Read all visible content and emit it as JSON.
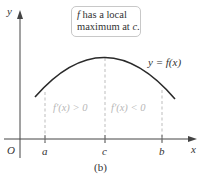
{
  "figure": {
    "caption": "(b)",
    "callout": {
      "line1_var": "f",
      "line1_rest": " has a local",
      "line2_text": "maximum at ",
      "line2_var": "c",
      "line2_end": "."
    },
    "curve_label": "y = f(x)",
    "axes": {
      "x_label": "x",
      "y_label": "y",
      "origin_label": "O",
      "ticks": [
        "a",
        "c",
        "b"
      ]
    },
    "regions": {
      "left": "f′(x) > 0",
      "right": "f′(x) < 0"
    },
    "colors": {
      "curve": "#2a2a2a",
      "axis": "#444444",
      "dashed": "#b5b5b5",
      "region_text": "#b8b8b8"
    }
  }
}
